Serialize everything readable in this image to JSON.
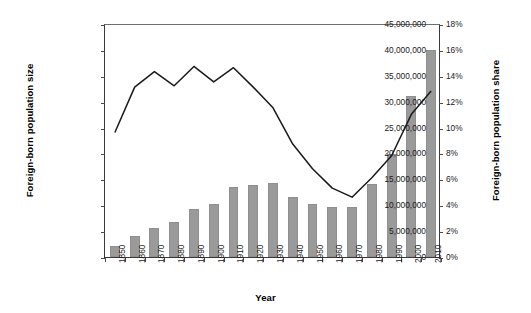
{
  "chart_data": {
    "type": "bar",
    "title": "",
    "xlabel": "Year",
    "ylabel": "Foreign-born population size",
    "ylabel_right": "Foreign-born population share",
    "grid": false,
    "legend": "none",
    "categories": [
      "1850",
      "1860",
      "1870",
      "1880",
      "1890",
      "1900",
      "1910",
      "1920",
      "1930",
      "1940",
      "1950",
      "1960",
      "1970",
      "1980",
      "1990",
      "2000",
      "2010"
    ],
    "ylim": [
      0,
      45000000
    ],
    "ytick_labels": [
      "0",
      "5,000,000",
      "10,000,000",
      "15,000,000",
      "20,000,000",
      "25,000,000",
      "30,000,000",
      "35,000,000",
      "40,000,000",
      "45,000,000"
    ],
    "ytick_values": [
      0,
      5000000,
      10000000,
      15000000,
      20000000,
      25000000,
      30000000,
      35000000,
      40000000,
      45000000
    ],
    "ylim_right": [
      0,
      18
    ],
    "ytick_labels_right": [
      "0%",
      "2%",
      "4%",
      "6%",
      "8%",
      "10%",
      "12%",
      "14%",
      "16%",
      "18%"
    ],
    "ytick_values_right": [
      0,
      2,
      4,
      6,
      8,
      10,
      12,
      14,
      16,
      18
    ],
    "series": [
      {
        "name": "Foreign-born population size",
        "type": "bar",
        "axis": "left",
        "color": "#9a9a9a",
        "values": [
          2200000,
          4100000,
          5600000,
          6700000,
          9200000,
          10300000,
          13500000,
          13900000,
          14200000,
          11600000,
          10300000,
          9700000,
          9600000,
          14100000,
          19800000,
          31100000,
          40000000
        ]
      },
      {
        "name": "Foreign-born population share",
        "type": "line",
        "axis": "right",
        "color": "#1a1a1a",
        "values": [
          9.7,
          13.2,
          14.4,
          13.3,
          14.8,
          13.6,
          14.7,
          13.2,
          11.6,
          8.8,
          6.9,
          5.4,
          4.7,
          6.2,
          7.9,
          11.1,
          12.9
        ]
      }
    ]
  }
}
